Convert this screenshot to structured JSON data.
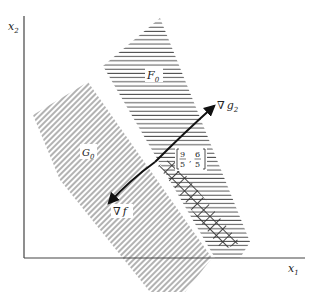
{
  "diagram": {
    "axes": {
      "x_label": "x",
      "x_sub": "1",
      "y_label": "x",
      "y_sub": "2"
    },
    "regions": [
      {
        "id": "F0",
        "label": "F",
        "sub": "0",
        "hatch": "horizontal"
      },
      {
        "id": "G0",
        "label": "G",
        "sub": "0",
        "hatch": "diagonal"
      },
      {
        "id": "overlap",
        "label": "",
        "hatch": "cross"
      }
    ],
    "vectors": [
      {
        "id": "grad-g2",
        "label": "∇",
        "name": "g",
        "sub": "2"
      },
      {
        "id": "grad-f",
        "label": "∇",
        "name": "f",
        "sub": ""
      }
    ],
    "point": {
      "x_num": "9",
      "x_den": "5",
      "y_num": "6",
      "y_den": "5"
    },
    "colors": {
      "line": "#222222",
      "hatch": "#555555",
      "background": "#ffffff"
    }
  }
}
